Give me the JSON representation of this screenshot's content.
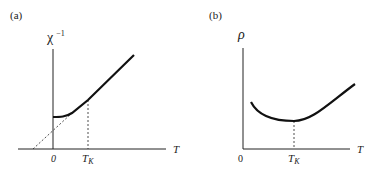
{
  "panels": [
    {
      "id": "a",
      "label": "(a)",
      "y_label_base": "χ",
      "y_label_sup": "−1",
      "x_label": "T",
      "tick_zero": "0",
      "tick_tk_base": "T",
      "tick_tk_sub": "K",
      "description": "Inverse susceptibility vs temperature: Curie-Weiss linear at high T, flattening below T_K; dashed extrapolation to negative T intercept"
    },
    {
      "id": "b",
      "label": "(b)",
      "y_label": "ρ",
      "x_label": "T",
      "tick_zero": "0",
      "tick_tk_base": "T",
      "tick_tk_sub": "K",
      "description": "Resistivity vs temperature with a minimum at T_K (Kondo effect)"
    }
  ],
  "colors": {
    "ink": "#222222",
    "background": "#ffffff"
  }
}
